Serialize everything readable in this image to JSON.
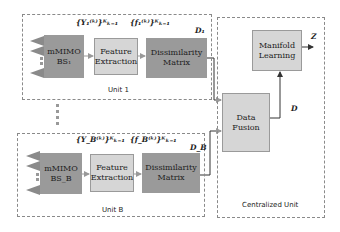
{
  "unit1": {
    "label": "Unit 1",
    "mmimo": "mMIMO\nBS₁",
    "feature": "Feature\nExtraction",
    "dissim": "Dissimilarity\nMatrix",
    "y_label": "{Y₁⁽ᵏ⁾}ᴷₖ₌₁",
    "f_label": "{f₁⁽ᵏ⁾}ᴷₖ₌₁",
    "d_label": "D₁"
  },
  "unitB": {
    "label": "Unit B",
    "mmimo": "mMIMO\nBS_B",
    "feature": "Feature\nExtraction",
    "dissim": "Dissimilarity\nMatrix",
    "y_label": "{Y_B⁽ᵏ⁾}ᴷₖ₌₁",
    "f_label": "{f_B⁽ᵏ⁾}ᴷₖ₌₁",
    "d_label": "D_B"
  },
  "central": {
    "label": "Centralized Unit",
    "fusion": "Data\nFusion",
    "manifold": "Manifold\nLearning",
    "d_label": "D",
    "z_label": "Z"
  }
}
